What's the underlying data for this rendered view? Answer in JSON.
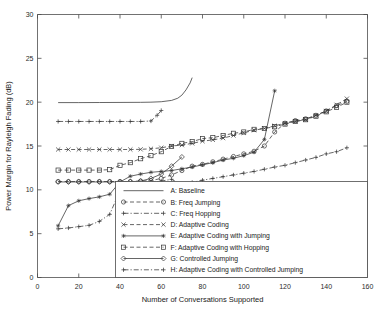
{
  "chart_data": {
    "type": "line",
    "title": "",
    "xlabel": "Number of Conversations Supported",
    "ylabel": "Power Margin for Rayleigh Fading (dB)",
    "xlim": [
      0,
      160
    ],
    "ylim": [
      0,
      30
    ],
    "xticks": [
      0,
      20,
      40,
      60,
      80,
      100,
      120,
      140,
      160
    ],
    "yticks": [
      0,
      5,
      10,
      15,
      20,
      25,
      30
    ],
    "grid": false,
    "legend_position": "lower-center-right",
    "series": [
      {
        "key": "A",
        "name": "A: Baseline",
        "marker": "none",
        "linestyle": "solid",
        "x": [
          10,
          20,
          30,
          40,
          50,
          55,
          60,
          65,
          68,
          70,
          72,
          74,
          75
        ],
        "y": [
          19.95,
          19.95,
          19.96,
          19.97,
          19.98,
          20.0,
          20.05,
          20.2,
          20.45,
          20.8,
          21.4,
          22.2,
          22.8
        ]
      },
      {
        "key": "B",
        "name": "B: Freq Jumping",
        "marker": "circle",
        "linestyle": "dashed",
        "x": [
          10,
          15,
          20,
          25,
          30,
          35,
          40,
          45,
          50,
          55,
          60,
          65,
          70,
          75,
          80,
          85,
          90,
          95,
          100,
          105,
          110,
          115,
          120,
          125,
          130,
          135,
          140,
          145,
          150
        ],
        "y": [
          10.95,
          10.95,
          10.95,
          10.95,
          10.95,
          10.95,
          10.95,
          10.95,
          11.0,
          11.05,
          11.3,
          11.7,
          12.2,
          12.7,
          12.9,
          13.2,
          13.5,
          13.8,
          14.1,
          14.4,
          15.0,
          16.6,
          17.6,
          17.9,
          18.1,
          18.5,
          19.0,
          19.6,
          20.1
        ]
      },
      {
        "key": "C",
        "name": "C: Freq Hopping",
        "marker": "plus",
        "linestyle": "dashdot",
        "x": [
          10,
          15,
          20,
          25,
          30,
          35,
          40,
          45,
          50,
          55,
          58,
          60
        ],
        "y": [
          17.8,
          17.8,
          17.8,
          17.8,
          17.8,
          17.8,
          17.8,
          17.8,
          17.8,
          17.85,
          18.5,
          19.05
        ]
      },
      {
        "key": "D",
        "name": "D: Adaptive Coding",
        "marker": "x",
        "linestyle": "dashed",
        "x": [
          10,
          15,
          20,
          25,
          30,
          35,
          40,
          45,
          50,
          55,
          60,
          65,
          70,
          75,
          80,
          85,
          90,
          95,
          100,
          105,
          110,
          115,
          120,
          125,
          130,
          135,
          140,
          145,
          150
        ],
        "y": [
          14.6,
          14.6,
          14.6,
          14.6,
          14.6,
          14.6,
          14.6,
          14.6,
          14.62,
          14.68,
          14.8,
          15.0,
          15.1,
          15.3,
          15.55,
          15.7,
          15.9,
          16.2,
          16.5,
          16.8,
          17.0,
          17.3,
          17.6,
          17.8,
          18.0,
          18.5,
          19.0,
          19.7,
          20.4
        ]
      },
      {
        "key": "E",
        "name": "E: Adaptive Coding with Jumping",
        "marker": "star",
        "linestyle": "solid",
        "x": [
          10,
          15,
          20,
          25,
          30,
          35,
          40,
          45,
          50,
          55,
          60,
          65,
          70,
          75,
          80,
          85,
          90,
          95,
          100,
          105,
          110,
          115
        ],
        "y": [
          5.9,
          8.2,
          8.75,
          9.0,
          9.2,
          9.5,
          10.9,
          11.55,
          11.8,
          12.0,
          12.1,
          12.2,
          12.4,
          12.6,
          12.85,
          13.1,
          13.4,
          13.6,
          13.9,
          14.3,
          15.75,
          21.3
        ]
      },
      {
        "key": "F",
        "name": "F: Adaptive Coding with Hopping",
        "marker": "square",
        "linestyle": "dashed",
        "x": [
          10,
          15,
          20,
          25,
          30,
          35,
          40,
          45,
          50,
          55,
          60,
          65,
          70,
          75,
          80,
          85,
          90,
          95,
          100,
          105,
          110,
          115,
          120,
          125,
          130,
          135,
          140,
          145,
          150
        ],
        "y": [
          12.25,
          12.25,
          12.25,
          12.25,
          12.25,
          12.3,
          12.8,
          13.1,
          13.55,
          13.9,
          14.35,
          14.95,
          15.3,
          15.5,
          15.85,
          15.95,
          16.2,
          16.45,
          16.6,
          16.9,
          17.0,
          17.2,
          17.5,
          17.8,
          18.0,
          18.4,
          18.9,
          19.4,
          20.0
        ]
      },
      {
        "key": "G",
        "name": "G: Controlled Jumping",
        "marker": "diamond",
        "linestyle": "solid",
        "x": [
          10,
          15,
          20,
          25,
          30,
          35,
          40,
          45,
          50,
          55,
          60,
          65,
          70
        ],
        "y": [
          10.9,
          10.9,
          10.9,
          10.9,
          10.9,
          10.9,
          10.9,
          10.92,
          11.0,
          11.3,
          11.8,
          12.7,
          13.75
        ]
      },
      {
        "key": "H",
        "name": "H: Adaptive Coding with Controlled Jumping",
        "marker": "plus",
        "linestyle": "dashdot",
        "x": [
          10,
          15,
          20,
          25,
          30,
          35,
          40,
          45,
          50,
          55,
          60,
          65,
          70,
          75,
          80,
          85,
          90,
          95,
          100,
          105,
          110,
          115,
          120,
          125,
          130,
          135,
          140,
          145,
          150
        ],
        "y": [
          5.55,
          5.65,
          5.8,
          5.95,
          6.4,
          7.2,
          9.9,
          10.4,
          10.7,
          10.85,
          11.0,
          11.2,
          10.55,
          10.85,
          11.1,
          11.3,
          11.5,
          11.7,
          11.9,
          12.1,
          12.35,
          12.6,
          12.8,
          13.1,
          13.4,
          13.7,
          14.1,
          14.35,
          14.8
        ]
      }
    ],
    "legend_entries": [
      {
        "key": "A",
        "label": "A: Baseline",
        "marker": "none",
        "linestyle": "solid"
      },
      {
        "key": "B",
        "label": "B: Freq Jumping",
        "marker": "circle",
        "linestyle": "dashed"
      },
      {
        "key": "C",
        "label": "C: Freq Hopping",
        "marker": "plus",
        "linestyle": "dashdot"
      },
      {
        "key": "D",
        "label": "D: Adaptive Coding",
        "marker": "x",
        "linestyle": "dashed"
      },
      {
        "key": "E",
        "label": "E: Adaptive Coding with Jumping",
        "marker": "star",
        "linestyle": "solid"
      },
      {
        "key": "F",
        "label": "F: Adaptive Coding with Hopping",
        "marker": "square",
        "linestyle": "dashed"
      },
      {
        "key": "G",
        "label": "G: Controlled Jumping",
        "marker": "diamond",
        "linestyle": "solid"
      },
      {
        "key": "H",
        "label": "H: Adaptive Coding with Controlled Jumping",
        "marker": "plus",
        "linestyle": "dashdot"
      }
    ],
    "colors": {
      "line": "#333333",
      "axis": "#4d4d4d",
      "background": "#ffffff"
    }
  }
}
